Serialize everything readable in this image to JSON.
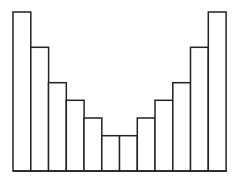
{
  "chart_data": {
    "type": "bar",
    "title": "",
    "xlabel": "",
    "ylabel": "",
    "categories": [
      "1",
      "2",
      "3",
      "4",
      "5",
      "6",
      "7",
      "8",
      "9",
      "10",
      "11",
      "12"
    ],
    "values": [
      9,
      7,
      5,
      4,
      3,
      2,
      2,
      3,
      4,
      5,
      7,
      9
    ],
    "ylim": [
      0,
      9
    ],
    "grid": false,
    "legend": null,
    "colors": {
      "bar_fill": "#ffffff",
      "bar_stroke": "#222222"
    }
  }
}
